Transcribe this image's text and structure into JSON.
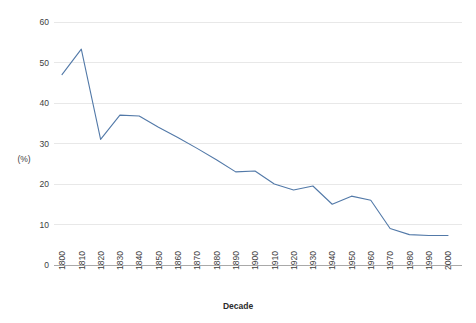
{
  "chart_data": {
    "type": "line",
    "title": "",
    "subtitle": "",
    "xlabel": "Decade",
    "ylabel": "(%)",
    "categories": [
      "1800",
      "1810",
      "1820",
      "1830",
      "1840",
      "1850",
      "1860",
      "1870",
      "1880",
      "1890",
      "1900",
      "1910",
      "1920",
      "1930",
      "1940",
      "1950",
      "1960",
      "1970",
      "1980",
      "1990",
      "2000"
    ],
    "values": [
      47.0,
      53.3,
      31.0,
      37.0,
      36.8,
      34.0,
      31.5,
      28.8,
      26.0,
      23.0,
      23.2,
      20.0,
      18.5,
      19.5,
      15.0,
      17.0,
      16.0,
      9.0,
      7.5,
      7.3,
      7.3
    ],
    "series": [
      {
        "name": "",
        "values": [
          47.0,
          53.3,
          31.0,
          37.0,
          36.8,
          34.0,
          31.5,
          28.8,
          26.0,
          23.0,
          23.2,
          20.0,
          18.5,
          19.5,
          15.0,
          17.0,
          16.0,
          9.0,
          7.5,
          7.3,
          7.3
        ]
      }
    ],
    "yticks": [
      0,
      10,
      20,
      30,
      40,
      50,
      60
    ],
    "ytick_labels": [
      "0",
      "10",
      "20",
      "30",
      "40",
      "50",
      "60"
    ],
    "ylim": [
      0,
      60
    ],
    "grid": true,
    "grid_axis": "y",
    "legend": false,
    "legend_position": "none",
    "line_color": "#5279a8",
    "grid_color": "#e8e8e8",
    "axis_color": "#a9a9a9",
    "text_color": "#3d3d3d",
    "background": "#ffffff",
    "xtick_rotation": -90
  }
}
